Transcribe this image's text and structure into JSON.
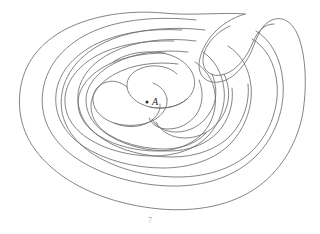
{
  "figure": {
    "kind": "labyrinth-diagram",
    "background_color": "#ffffff",
    "line_color": "#6e6e72",
    "line_width": 0.85,
    "width": 320,
    "height": 234
  },
  "center": {
    "label": "A",
    "dot_label": "center-point",
    "dot_x": 147,
    "dot_y": 102,
    "label_x": 152,
    "label_y": 105,
    "color": "#2b2b2b"
  },
  "caption": {
    "text": "7",
    "x": 150,
    "y": 223,
    "color": "#b8b8bc"
  },
  "paths": {
    "outer_boundary": "M 245 14 C 218 22 204 42 200 58 C 196 74 205 84 219 82 C 233 80 245 66 252 50 C 258 34 262 24 272 20 C 284 15 294 24 299 38 C 306 58 307 86 303 112 C 298 141 283 168 259 186 C 232 206 196 212 160 209 C 118 205 78 191 51 167 C 26 145 17 119 20 92 C 23 63 41 42 66 29 C 94 15 129 10 163 13 C 192 16 222 12 245 14 Z",
    "ring_1": "M 230 26 C 212 34 202 50 203 62 C 204 73 214 78 225 74 C 237 70 247 57 253 42 C 258 30 265 24 274 24",
    "ring_2": "M 196 20 C 160 16 122 19 94 31 C 66 43 47 64 43 90 C 39 116 50 139 73 156 C 98 174 134 185 170 186 C 205 187 236 176 256 156 C 276 136 285 108 283 82 C 281 58 271 40 256 31",
    "ring_3": "M 205 30 C 172 26 136 29 110 40 C 84 51 66 70 62 93 C 58 117 69 137 90 152 C 113 168 146 177 178 177 C 209 177 237 167 254 149 C 271 131 279 106 277 84 C 275 63 266 47 252 39",
    "ring_4": "M 182 30 C 149 28 117 33 94 45 C 72 57 58 74 56 94 C 54 115 64 133 83 146 C 104 160 134 168 163 168 C 191 168 216 159 231 143 C 246 127 253 105 251 86 C 249 68 241 54 228 46",
    "ring_5": "M 196 41 C 166 37 135 41 113 52 C 92 62 79 78 78 95 C 77 113 86 128 103 139 C 121 151 147 157 172 157 C 196 157 218 149 231 135 C 244 121 250 101 248 84",
    "ring_6": "M 174 41 C 144 40 116 45 96 56 C 77 67 66 82 65 98 C 64 115 73 129 89 139 C 106 150 130 156 153 156 C 176 156 196 149 208 136 C 220 123 226 105 224 89 C 222 73 215 60 203 52",
    "ring_7": "M 188 52 C 161 49 134 53 115 63 C 97 72 86 86 86 100 C 86 115 95 127 110 136 C 126 146 148 151 169 151 C 189 151 207 144 218 132 C 229 120 234 103 232 88",
    "spiral_core_a": "M 165 53 C 141 53 118 58 102 68 C 87 77 78 90 78 103 C 78 117 87 129 101 137 C 116 146 137 151 157 151 C 176 151 193 144 203 133 C 213 122 217 107 215 93 C 213 80 206 69 195 62",
    "spiral_core_b": "M 178 64 C 155 61 131 65 115 74 C 100 82 91 94 91 106 C 91 119 99 130 113 137 C 128 145 147 149 165 149 C 182 149 197 143 206 133",
    "meander_top": "M 113 62 C 123 55 139 51 154 52 C 170 53 183 59 190 69 C 197 79 196 91 187 99 C 178 107 163 110 150 107",
    "meander_mid": "M 187 99 C 178 107 163 110 150 107 C 137 104 128 96 127 87 C 126 78 133 70 145 67 C 157 64 170 67 177 74",
    "meander_bottom": "M 127 87 C 121 82 114 80 107 82 C 98 84 92 92 93 101 C 94 111 102 119 114 123 C 127 127 143 126 154 120 C 163 115 168 107 167 99",
    "meander_tail": "M 167 99 C 166 92 161 86 153 83",
    "inner_lobe": "M 114 123 C 123 127 135 128 145 124 C 155 120 161 112 160 104",
    "right_hook_outer": "M 252 50 C 246 67 233 80 219 82 C 205 84 196 74 200 58",
    "right_lobe_1": "M 224 74 C 231 88 230 104 222 117 C 214 130 200 138 185 138 C 172 138 161 132 156 122",
    "right_lobe_2": "M 212 74 C 218 88 217 103 209 114 C 201 126 189 132 176 132 C 165 132 156 127 152 119",
    "right_lobe_3": "M 199 80 C 204 92 203 105 196 115 C 189 124 179 129 168 129 C 159 129 152 125 149 118",
    "bottom_sweep_1": "M 51 167 C 78 191 118 205 160 209 C 196 212 232 206 259 186",
    "bottom_sweep_2": "M 43 90 C 39 116 50 139 73 156 C 98 174 134 185 170 186 C 205 187 236 176 256 156",
    "left_arc_1": "M 20 92 C 17 119 26 145 51 167",
    "left_arc_2": "M 62 93 C 58 117 69 137 90 152",
    "top_arc_1": "M 66 29 C 94 15 129 10 163 13",
    "top_arc_2": "M 94 31 C 122 19 160 16 196 20",
    "top_arc_3": "M 110 40 C 136 29 172 26 205 30",
    "top_arc_4": "M 94 45 C 117 33 149 28 182 30",
    "top_arc_5": "M 113 52 C 135 41 166 37 196 41",
    "top_arc_6": "M 96 56 C 116 45 144 40 174 41"
  },
  "paths_order": [
    "outer_boundary",
    "ring_1",
    "ring_2",
    "ring_3",
    "ring_4",
    "ring_5",
    "ring_6",
    "ring_7",
    "spiral_core_a",
    "spiral_core_b",
    "meander_top",
    "meander_mid",
    "meander_bottom",
    "meander_tail",
    "inner_lobe",
    "right_lobe_1",
    "right_lobe_2",
    "right_lobe_3"
  ]
}
